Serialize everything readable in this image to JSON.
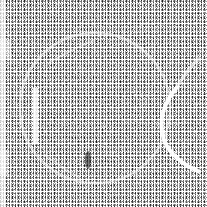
{
  "image": {
    "description": "Dithered black-and-white noise texture with faint large circle and white arcs",
    "width": 207,
    "height": 207,
    "colors": {
      "background": "#ffffff",
      "ink": "#1a1a1a",
      "mid": "#8a8a8a"
    },
    "features": {
      "circle": {
        "cx": 95,
        "cy": 108,
        "r": 75
      },
      "right_arc": {
        "cx": 205,
        "cy": 130,
        "r": 48
      },
      "left_bar": {
        "x": 33,
        "y": 88,
        "w": 5,
        "h": 55
      }
    }
  }
}
